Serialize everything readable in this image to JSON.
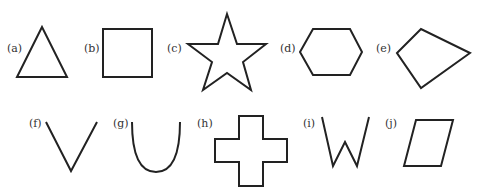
{
  "figure": {
    "shapes": [
      {
        "label": "(a)",
        "name": "triangle"
      },
      {
        "label": "(b)",
        "name": "square"
      },
      {
        "label": "(c)",
        "name": "star"
      },
      {
        "label": "(d)",
        "name": "hexagon"
      },
      {
        "label": "(e)",
        "name": "quadrilateral"
      },
      {
        "label": "(f)",
        "name": "v-shape"
      },
      {
        "label": "(g)",
        "name": "u-curve"
      },
      {
        "label": "(h)",
        "name": "cross"
      },
      {
        "label": "(i)",
        "name": "w-shape"
      },
      {
        "label": "(j)",
        "name": "parallelogram"
      }
    ],
    "stroke_color": "#222222",
    "background": "#ffffff"
  }
}
